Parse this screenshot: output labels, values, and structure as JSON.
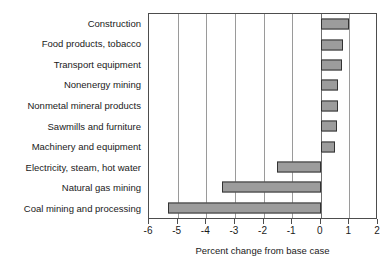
{
  "chart_data": {
    "type": "bar",
    "orientation": "horizontal",
    "title": "",
    "xlabel": "Percent change from base case",
    "ylabel": "",
    "xlim": [
      -6,
      2
    ],
    "xticks": [
      -6,
      -5,
      -4,
      -3,
      -2,
      -1,
      0,
      1,
      2
    ],
    "xtick_labels": [
      "-6",
      "-5",
      "-4",
      "-3",
      "-2",
      "-1",
      "0",
      "1",
      "2"
    ],
    "grid": "vertical",
    "legend": "none",
    "categories": [
      "Construction",
      "Food products, tobacco",
      "Transport equipment",
      "Nonenergy mining",
      "Nonmetal mineral products",
      "Sawmills and furniture",
      "Machinery and equipment",
      "Electricity, steam, hot water",
      "Natural gas mining",
      "Coal mining and processing"
    ],
    "values": [
      1.0,
      0.78,
      0.74,
      0.62,
      0.6,
      0.56,
      0.5,
      -1.53,
      -3.45,
      -5.35
    ],
    "bar_color": "#9c9c9c",
    "bar_edge_color": "#333333",
    "axis_color": "#4d4d4d",
    "grid_color": "#9a9a9a"
  }
}
